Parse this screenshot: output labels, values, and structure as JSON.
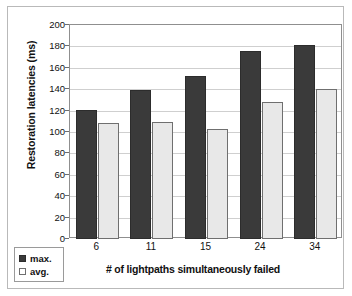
{
  "chart_data": {
    "type": "bar",
    "title": "",
    "xlabel": "# of lightpaths simultaneously failed",
    "ylabel": "Restoration latencies (ms)",
    "categories": [
      "6",
      "11",
      "15",
      "24",
      "34"
    ],
    "series": [
      {
        "name": "max.",
        "values": [
          121,
          139,
          152,
          176,
          181
        ],
        "color": "#3a3a3a"
      },
      {
        "name": "avg.",
        "values": [
          108,
          109,
          103,
          128,
          140
        ],
        "color": "#e8e8e8"
      }
    ],
    "ylim": [
      0,
      200
    ],
    "ytick_step": 20,
    "yticks": [
      200,
      180,
      160,
      140,
      120,
      100,
      80,
      60,
      40,
      20,
      0
    ],
    "grid": true,
    "legend_position": "bottom-left"
  },
  "legend": {
    "items": [
      {
        "label": "max."
      },
      {
        "label": "avg."
      }
    ]
  },
  "colors": {
    "series_max": "#3a3a3a",
    "series_avg": "#e8e8e8",
    "gridline": "#cfcfcf",
    "frame": "#8f8f8f",
    "text": "#111111"
  }
}
